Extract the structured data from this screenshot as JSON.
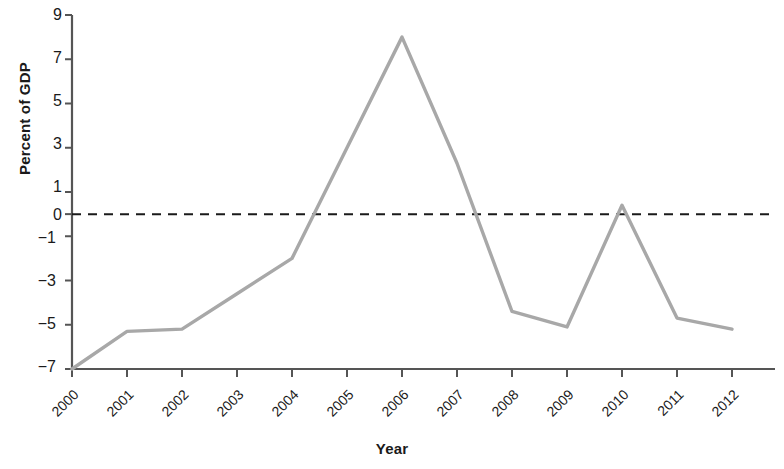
{
  "chart_data": {
    "type": "line",
    "title": "",
    "subtitle": "",
    "xlabel": "Year",
    "ylabel": "Percent of GDP",
    "x": [
      2000,
      2001,
      2002,
      2003,
      2004,
      2005,
      2006,
      2007,
      2008,
      2009,
      2010,
      2011,
      2012
    ],
    "categories": [
      "2000",
      "2001",
      "2002",
      "2003",
      "2004",
      "2005",
      "2006",
      "2007",
      "2008",
      "2009",
      "2010",
      "2011",
      "2012"
    ],
    "values": [
      -7.0,
      -5.3,
      -5.2,
      -3.6,
      -2.0,
      3.0,
      8.0,
      2.3,
      -4.4,
      -5.1,
      0.4,
      -4.7,
      -5.2
    ],
    "series": [
      {
        "name": "Percent of GDP",
        "values": [
          -7.0,
          -5.3,
          -5.2,
          -3.6,
          -2.0,
          3.0,
          8.0,
          2.3,
          -4.4,
          -5.1,
          0.4,
          -4.7,
          -5.2
        ],
        "color": "#a8a8a8"
      }
    ],
    "xlim": [
      2000,
      2012
    ],
    "ylim": [
      -7,
      9
    ],
    "ytick_values": [
      9,
      7,
      5,
      3,
      1,
      0,
      -1,
      -3,
      -5,
      -7
    ],
    "ytick_labels": [
      "9",
      "7",
      "5",
      "3",
      "1",
      "0",
      "−1",
      "−3",
      "−5",
      "−7"
    ],
    "xtick_labels": [
      "2000",
      "2001",
      "2002",
      "2003",
      "2004",
      "2005",
      "2006",
      "2007",
      "2008",
      "2009",
      "2010",
      "2011",
      "2012"
    ],
    "grid": false,
    "legend": false,
    "legend_position": "none",
    "annotations": [
      {
        "name": "zero-reference-line",
        "type": "hline",
        "y": 0,
        "style": "dashed",
        "color": "#1a1a1a"
      }
    ],
    "line_color": "#a8a8a8",
    "axis_color": "#555555",
    "text_color": "#1a1a1a",
    "background": "#ffffff"
  }
}
